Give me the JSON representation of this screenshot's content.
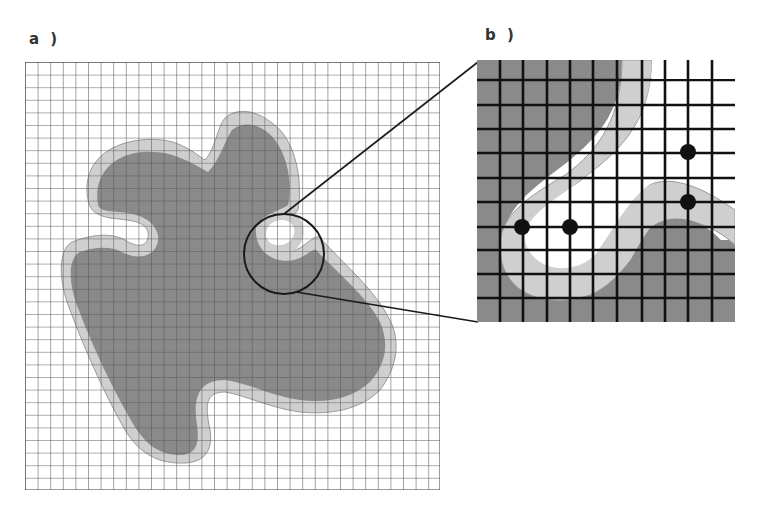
{
  "figure": {
    "panels": [
      {
        "id": "a",
        "label": "a )",
        "description": "Overview grid with irregular shaded region (dark core, light boundary band) and a circled zoom region"
      },
      {
        "id": "b",
        "label": "b )",
        "description": "Magnified view of circled region showing grid cells, boundary band, and four sample points"
      }
    ],
    "legend": {
      "interior_color": "#8a8a8a",
      "band_color": "#c8c8c8",
      "background_color": "#ffffff",
      "grid_color": "#555555",
      "point_color": "#111111"
    },
    "zoom_panel_points": [
      {
        "x": 522,
        "y": 227
      },
      {
        "x": 570,
        "y": 227
      },
      {
        "x": 688,
        "y": 152
      },
      {
        "x": 688,
        "y": 202
      }
    ]
  }
}
